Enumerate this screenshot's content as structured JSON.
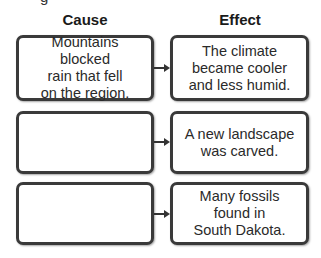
{
  "cropped_top_text": "g",
  "headers": {
    "cause": "Cause",
    "effect": "Effect"
  },
  "rows": [
    {
      "cause": "Mountains blocked\nrain that fell\non the region.",
      "effect": "The climate\nbecame cooler\nand less humid."
    },
    {
      "cause": "",
      "effect": "A new landscape\nwas carved."
    },
    {
      "cause": "",
      "effect": "Many fossils\nfound in\nSouth Dakota."
    }
  ],
  "colors": {
    "border": "#3a3a3a",
    "text": "#2a2a2a",
    "background": "#ffffff"
  }
}
